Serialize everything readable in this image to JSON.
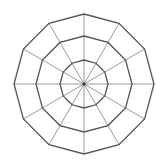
{
  "diagram": {
    "type": "radar-grid",
    "shape": "dodecagon",
    "sides": 12,
    "rings": 3,
    "spokes": 12,
    "center": [
      84,
      84
    ],
    "ring_radii": [
      24,
      48,
      70
    ],
    "colors": {
      "background": "#ffffff",
      "ring_stroke": "#555555",
      "spoke_stroke": "#9a9a9a",
      "center_dot": "#333333"
    }
  }
}
